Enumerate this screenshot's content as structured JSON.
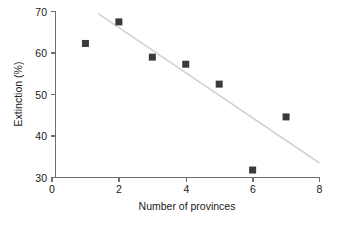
{
  "chart_data": {
    "type": "scatter",
    "title": "",
    "subtitle": "",
    "xlabel": "Number of provinces",
    "ylabel": "Extinction (%)",
    "xlim": [
      0,
      8
    ],
    "ylim": [
      30,
      70
    ],
    "xticks": [
      0,
      2,
      4,
      6,
      8
    ],
    "yticks": [
      30,
      40,
      50,
      60,
      70
    ],
    "xtick_labels": [
      "0",
      "2",
      "4",
      "6",
      "8"
    ],
    "ytick_labels": [
      "30",
      "40",
      "50",
      "60",
      "70"
    ],
    "grid": false,
    "legend": false,
    "legend_position": "none",
    "marker_shape": "square",
    "marker_color": "#3a3a3a",
    "trendline_color": "#d2d2d2",
    "axis_color": "#6e6e6e",
    "background_color": "#ffffff",
    "x": [
      1,
      2,
      3,
      4,
      5,
      6,
      7
    ],
    "y": [
      62.3,
      67.5,
      59.0,
      57.3,
      52.5,
      31.8,
      44.6
    ],
    "points": [
      {
        "x": 1,
        "y": 62.3
      },
      {
        "x": 2,
        "y": 67.5
      },
      {
        "x": 3,
        "y": 59.0
      },
      {
        "x": 4,
        "y": 57.3
      },
      {
        "x": 5,
        "y": 52.5
      },
      {
        "x": 6,
        "y": 31.8
      },
      {
        "x": 7,
        "y": 44.6
      }
    ],
    "series": [
      {
        "name": "Extinction vs provinces",
        "values": [
          62.3,
          67.5,
          59.0,
          57.3,
          52.5,
          31.8,
          44.6
        ]
      }
    ],
    "trendline": {
      "type": "linear-fit",
      "x_start": 1.38,
      "y_start": 69.5,
      "x_end": 8.0,
      "y_end": 33.5
    },
    "annotations": []
  },
  "axes": {
    "x_label": "Number of provinces",
    "y_label": "Extinction (%)"
  }
}
